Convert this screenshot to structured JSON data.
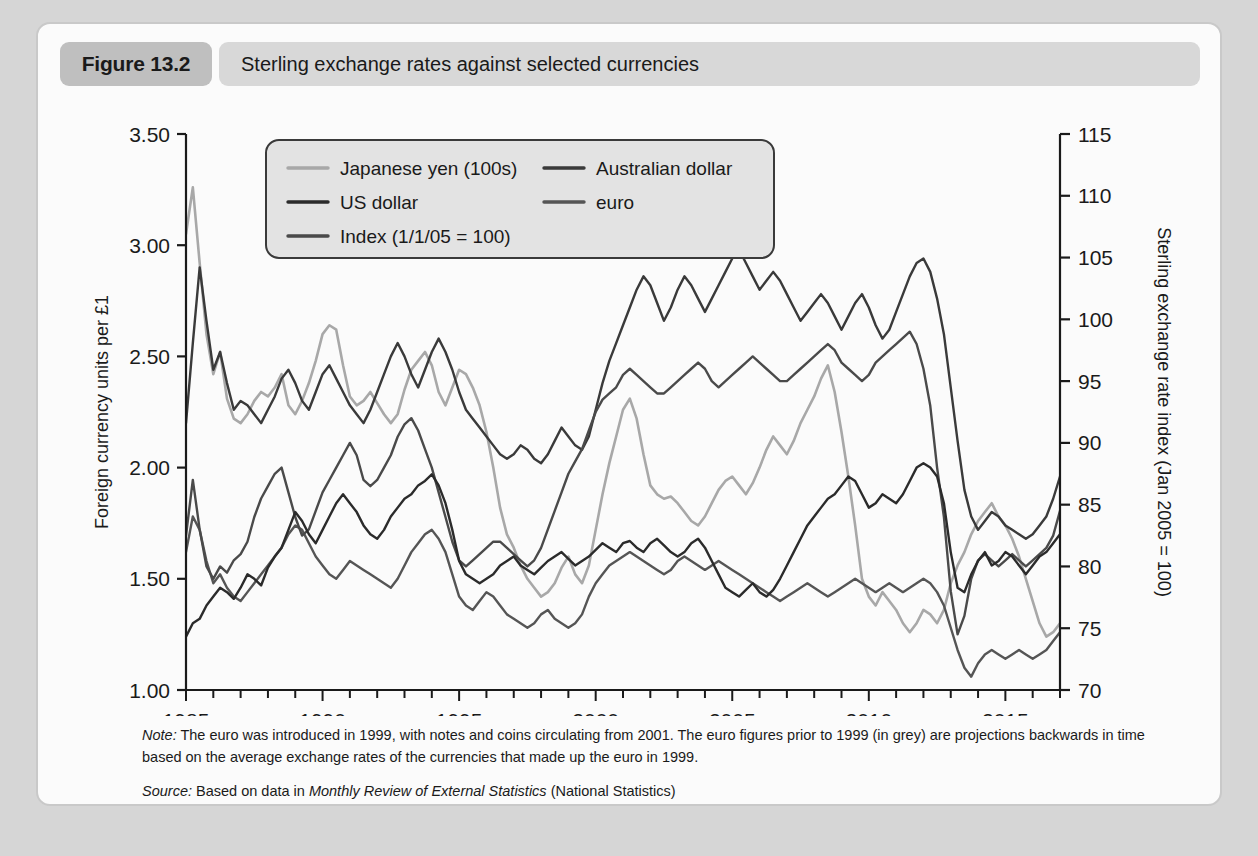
{
  "figure": {
    "number_label": "Figure 13.2",
    "title": "Sterling exchange rates against selected currencies"
  },
  "note": {
    "label": "Note:",
    "text": " The euro was introduced in 1999, with notes and coins circulating from 2001. The euro figures prior to 1999 (in grey) are projections backwards in time based on the average exchange rates of the currencies that made up the euro in 1999."
  },
  "source": {
    "label": "Source:",
    "prefix": " Based on data in ",
    "publication": "Monthly Review of External Statistics",
    "suffix": " (National Statistics)"
  },
  "chart_data": {
    "type": "line",
    "title": "Sterling exchange rates against selected currencies",
    "xlabel": "",
    "ylabel": "Foreign currency units per £1",
    "y2label": "Sterling exchange rate index (Jan 2005 = 100)",
    "xlim": [
      1985,
      2017
    ],
    "ylim": [
      1.0,
      3.5
    ],
    "y2lim": [
      70,
      115
    ],
    "grid": false,
    "legend_position": "top-left-inside",
    "xticks": [
      1985,
      1990,
      1995,
      2000,
      2005,
      2010,
      2015
    ],
    "xtick_labels": [
      "1985",
      "1990",
      "1995",
      "2000",
      "2005",
      "2010",
      "2015"
    ],
    "xminor_tick_step": 1,
    "yticks": [
      1.0,
      1.5,
      2.0,
      2.5,
      3.0,
      3.5
    ],
    "ytick_labels": [
      "1.00",
      "1.50",
      "2.00",
      "2.50",
      "3.00",
      "3.50"
    ],
    "y2ticks": [
      70,
      75,
      80,
      85,
      90,
      95,
      100,
      105,
      110,
      115
    ],
    "y2tick_labels": [
      "70",
      "75",
      "80",
      "85",
      "90",
      "95",
      "100",
      "105",
      "110",
      "115"
    ],
    "colors": {
      "japanese_yen": "#a8a8a8",
      "us_dollar": "#2b2b2b",
      "index": "#4a4a4a",
      "australian_dollar": "#3a3a3a",
      "euro": "#555555"
    },
    "x_step": 0.25,
    "x_start": 1985.0,
    "series": [
      {
        "name": "Japanese yen (100s)",
        "axis": "left",
        "color": "#a8a8a8",
        "values": [
          3.05,
          3.26,
          2.92,
          2.6,
          2.42,
          2.52,
          2.31,
          2.22,
          2.2,
          2.24,
          2.3,
          2.34,
          2.32,
          2.36,
          2.42,
          2.28,
          2.24,
          2.3,
          2.38,
          2.48,
          2.6,
          2.64,
          2.62,
          2.46,
          2.32,
          2.28,
          2.3,
          2.34,
          2.29,
          2.24,
          2.2,
          2.24,
          2.35,
          2.44,
          2.48,
          2.52,
          2.46,
          2.34,
          2.28,
          2.36,
          2.44,
          2.42,
          2.36,
          2.28,
          2.16,
          2.0,
          1.82,
          1.7,
          1.64,
          1.56,
          1.5,
          1.46,
          1.42,
          1.44,
          1.48,
          1.55,
          1.6,
          1.52,
          1.48,
          1.56,
          1.72,
          1.88,
          2.02,
          2.14,
          2.26,
          2.31,
          2.22,
          2.06,
          1.92,
          1.88,
          1.86,
          1.87,
          1.84,
          1.8,
          1.76,
          1.74,
          1.78,
          1.84,
          1.9,
          1.94,
          1.96,
          1.92,
          1.88,
          1.93,
          2.0,
          2.08,
          2.14,
          2.1,
          2.06,
          2.12,
          2.2,
          2.26,
          2.32,
          2.4,
          2.46,
          2.34,
          2.16,
          1.96,
          1.74,
          1.5,
          1.42,
          1.38,
          1.44,
          1.4,
          1.36,
          1.3,
          1.26,
          1.3,
          1.36,
          1.34,
          1.3,
          1.36,
          1.48,
          1.56,
          1.62,
          1.7,
          1.76,
          1.8,
          1.84,
          1.78,
          1.74,
          1.68,
          1.6,
          1.5,
          1.4,
          1.3,
          1.24,
          1.26,
          1.3
        ]
      },
      {
        "name": "US dollar",
        "axis": "left",
        "color": "#2b2b2b",
        "values": [
          1.24,
          1.3,
          1.32,
          1.38,
          1.42,
          1.46,
          1.44,
          1.41,
          1.46,
          1.52,
          1.5,
          1.47,
          1.55,
          1.6,
          1.64,
          1.72,
          1.8,
          1.76,
          1.7,
          1.66,
          1.72,
          1.78,
          1.84,
          1.88,
          1.84,
          1.8,
          1.74,
          1.7,
          1.68,
          1.72,
          1.78,
          1.82,
          1.86,
          1.88,
          1.92,
          1.94,
          1.97,
          1.92,
          1.84,
          1.72,
          1.58,
          1.52,
          1.5,
          1.48,
          1.5,
          1.52,
          1.56,
          1.58,
          1.6,
          1.56,
          1.54,
          1.52,
          1.55,
          1.58,
          1.6,
          1.62,
          1.59,
          1.56,
          1.58,
          1.6,
          1.63,
          1.66,
          1.64,
          1.62,
          1.66,
          1.67,
          1.64,
          1.62,
          1.66,
          1.68,
          1.65,
          1.62,
          1.6,
          1.62,
          1.66,
          1.68,
          1.64,
          1.58,
          1.52,
          1.46,
          1.44,
          1.42,
          1.45,
          1.48,
          1.44,
          1.42,
          1.45,
          1.5,
          1.56,
          1.62,
          1.68,
          1.74,
          1.78,
          1.82,
          1.86,
          1.88,
          1.92,
          1.96,
          1.94,
          1.88,
          1.82,
          1.84,
          1.88,
          1.86,
          1.84,
          1.88,
          1.94,
          2.0,
          2.02,
          2.0,
          1.96,
          1.84,
          1.62,
          1.46,
          1.44,
          1.52,
          1.58,
          1.62,
          1.56,
          1.58,
          1.62,
          1.6,
          1.56,
          1.52,
          1.56,
          1.6,
          1.62,
          1.66,
          1.7,
          1.64,
          1.56,
          1.48,
          1.42,
          1.38,
          1.3,
          1.24,
          1.28,
          1.22
        ]
      },
      {
        "name": "Index (1/1/05 = 100)",
        "axis": "right",
        "color": "#4a4a4a",
        "values": [
          82.5,
          87.0,
          83.0,
          80.0,
          79.0,
          80.0,
          79.5,
          80.5,
          81.0,
          82.0,
          84.0,
          85.5,
          86.5,
          87.5,
          88.0,
          86.0,
          84.0,
          82.5,
          83.0,
          84.5,
          86.0,
          87.0,
          88.0,
          89.0,
          90.0,
          89.0,
          87.0,
          86.5,
          87.0,
          88.0,
          89.0,
          90.5,
          91.5,
          92.0,
          91.0,
          89.5,
          88.0,
          86.0,
          84.0,
          82.0,
          80.5,
          80.0,
          80.5,
          81.0,
          81.5,
          82.0,
          82.0,
          81.5,
          81.0,
          80.5,
          80.0,
          80.5,
          81.5,
          83.0,
          84.5,
          86.0,
          87.5,
          88.5,
          89.5,
          91.0,
          92.5,
          93.5,
          94.0,
          94.5,
          95.5,
          96.0,
          95.5,
          95.0,
          94.5,
          94.0,
          94.0,
          94.5,
          95.0,
          95.5,
          96.0,
          96.5,
          96.0,
          95.0,
          94.5,
          95.0,
          95.5,
          96.0,
          96.5,
          97.0,
          96.5,
          96.0,
          95.5,
          95.0,
          95.0,
          95.5,
          96.0,
          96.5,
          97.0,
          97.5,
          98.0,
          97.5,
          96.5,
          96.0,
          95.5,
          95.0,
          95.5,
          96.5,
          97.0,
          97.5,
          98.0,
          98.5,
          99.0,
          98.0,
          96.0,
          93.0,
          88.0,
          84.0,
          78.0,
          74.5,
          76.0,
          79.0,
          80.5,
          81.0,
          80.5,
          80.0,
          80.5,
          81.0,
          80.5,
          80.0,
          80.5,
          81.0,
          81.5,
          82.5,
          84.5,
          85.5,
          84.5,
          83.0,
          81.0,
          79.0,
          76.5,
          74.5,
          75.0,
          74.0
        ]
      },
      {
        "name": "Australian dollar",
        "axis": "left",
        "color": "#3a3a3a",
        "values": [
          2.2,
          2.56,
          2.9,
          2.66,
          2.44,
          2.52,
          2.38,
          2.26,
          2.3,
          2.28,
          2.24,
          2.2,
          2.26,
          2.32,
          2.4,
          2.44,
          2.38,
          2.3,
          2.26,
          2.34,
          2.42,
          2.46,
          2.4,
          2.34,
          2.28,
          2.24,
          2.2,
          2.26,
          2.34,
          2.42,
          2.5,
          2.56,
          2.5,
          2.42,
          2.36,
          2.44,
          2.52,
          2.58,
          2.52,
          2.44,
          2.34,
          2.26,
          2.22,
          2.18,
          2.14,
          2.1,
          2.06,
          2.04,
          2.06,
          2.1,
          2.08,
          2.04,
          2.02,
          2.06,
          2.12,
          2.18,
          2.14,
          2.1,
          2.08,
          2.14,
          2.26,
          2.38,
          2.48,
          2.56,
          2.64,
          2.72,
          2.8,
          2.86,
          2.82,
          2.74,
          2.66,
          2.72,
          2.8,
          2.86,
          2.82,
          2.76,
          2.7,
          2.76,
          2.82,
          2.88,
          2.94,
          2.98,
          2.92,
          2.86,
          2.8,
          2.84,
          2.88,
          2.84,
          2.78,
          2.72,
          2.66,
          2.7,
          2.74,
          2.78,
          2.74,
          2.68,
          2.62,
          2.68,
          2.74,
          2.78,
          2.72,
          2.64,
          2.58,
          2.62,
          2.7,
          2.78,
          2.86,
          2.92,
          2.94,
          2.88,
          2.76,
          2.6,
          2.36,
          2.12,
          1.9,
          1.78,
          1.72,
          1.76,
          1.8,
          1.78,
          1.74,
          1.72,
          1.7,
          1.68,
          1.7,
          1.74,
          1.78,
          1.86,
          1.96,
          2.04,
          2.1,
          2.16,
          2.1,
          2.02,
          1.9,
          1.78,
          1.74,
          1.62
        ]
      },
      {
        "name": "euro",
        "axis": "left",
        "color": "#555555",
        "values": [
          1.62,
          1.78,
          1.72,
          1.58,
          1.48,
          1.52,
          1.46,
          1.42,
          1.4,
          1.44,
          1.48,
          1.52,
          1.56,
          1.6,
          1.64,
          1.7,
          1.74,
          1.72,
          1.66,
          1.6,
          1.56,
          1.52,
          1.5,
          1.54,
          1.58,
          1.56,
          1.54,
          1.52,
          1.5,
          1.48,
          1.46,
          1.5,
          1.56,
          1.62,
          1.66,
          1.7,
          1.72,
          1.68,
          1.62,
          1.52,
          1.42,
          1.38,
          1.36,
          1.4,
          1.44,
          1.42,
          1.38,
          1.34,
          1.32,
          1.3,
          1.28,
          1.3,
          1.34,
          1.36,
          1.32,
          1.3,
          1.28,
          1.3,
          1.34,
          1.42,
          1.48,
          1.52,
          1.56,
          1.58,
          1.6,
          1.62,
          1.6,
          1.58,
          1.56,
          1.54,
          1.52,
          1.54,
          1.58,
          1.6,
          1.58,
          1.56,
          1.54,
          1.56,
          1.58,
          1.56,
          1.54,
          1.52,
          1.5,
          1.48,
          1.46,
          1.44,
          1.42,
          1.4,
          1.42,
          1.44,
          1.46,
          1.48,
          1.46,
          1.44,
          1.42,
          1.44,
          1.46,
          1.48,
          1.5,
          1.48,
          1.46,
          1.44,
          1.46,
          1.48,
          1.46,
          1.44,
          1.46,
          1.48,
          1.5,
          1.48,
          1.44,
          1.38,
          1.28,
          1.18,
          1.1,
          1.06,
          1.12,
          1.16,
          1.18,
          1.16,
          1.14,
          1.16,
          1.18,
          1.16,
          1.14,
          1.16,
          1.18,
          1.22,
          1.26,
          1.32,
          1.38,
          1.42,
          1.4,
          1.36,
          1.28,
          1.2,
          1.14,
          1.12
        ]
      }
    ],
    "legend_entries": [
      {
        "label": "Japanese yen (100s)",
        "color": "#a8a8a8",
        "column": 0
      },
      {
        "label": "US dollar",
        "color": "#2b2b2b",
        "column": 0
      },
      {
        "label": "Index (1/1/05 = 100)",
        "color": "#4a4a4a",
        "column": 0
      },
      {
        "label": "Australian dollar",
        "color": "#3a3a3a",
        "column": 1
      },
      {
        "label": "euro",
        "color": "#555555",
        "column": 1
      }
    ]
  }
}
